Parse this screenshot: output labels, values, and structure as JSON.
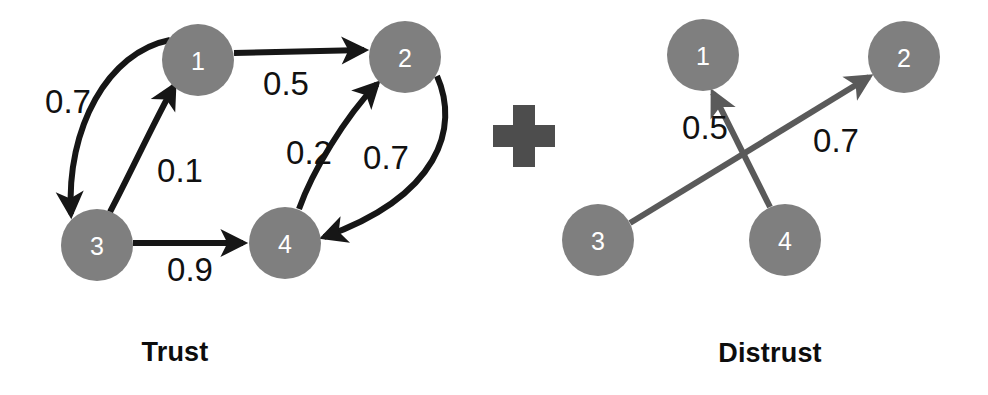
{
  "figure": {
    "width": 988,
    "height": 395,
    "background": "#ffffff",
    "operator": {
      "name": "plus-sign",
      "symbol": "+",
      "color": "#4d4d4d",
      "x": 524,
      "y": 136,
      "size": 62,
      "arm": 21
    }
  },
  "colors": {
    "node_fill": "#7f7f7f",
    "node_text": "#ffffff",
    "trust_edge": "#161616",
    "distrust_edge": "#5a5a5a",
    "weight_text": "#111111",
    "caption_text": "#0d0d0d"
  },
  "panels": [
    {
      "id": "trust",
      "caption": "Trust",
      "caption_x": 175,
      "caption_y": 352,
      "edge_color": "#161616",
      "edge_width": 6,
      "nodes": [
        {
          "id": "1",
          "label": "1",
          "cx": 198,
          "cy": 60,
          "r": 36
        },
        {
          "id": "2",
          "label": "2",
          "cx": 405,
          "cy": 57,
          "r": 36
        },
        {
          "id": "3",
          "label": "3",
          "cx": 97,
          "cy": 245,
          "r": 36
        },
        {
          "id": "4",
          "label": "4",
          "cx": 285,
          "cy": 243,
          "r": 36
        }
      ],
      "edges": [
        {
          "name": "edge-1-to-2",
          "from": "1",
          "to": "2",
          "weight": "0.5",
          "path": "M 234 53 L 364 50",
          "label_x": 286,
          "label_y": 83
        },
        {
          "name": "edge-1-to-3",
          "from": "1",
          "to": "3",
          "weight": "0.7",
          "path": "M 170 40 C 108 52, 66 128, 71 214",
          "label_x": 68,
          "label_y": 101
        },
        {
          "name": "edge-3-to-1",
          "from": "3",
          "to": "1",
          "weight": "0.1",
          "path": "M 110 212 C 132 170, 155 120, 174 86",
          "label_x": 180,
          "label_y": 170
        },
        {
          "name": "edge-3-to-4",
          "from": "3",
          "to": "4",
          "weight": "0.9",
          "path": "M 133 243 L 243 243",
          "label_x": 190,
          "label_y": 269
        },
        {
          "name": "edge-4-to-2",
          "from": "4",
          "to": "2",
          "weight": "0.2",
          "path": "M 299 209 C 312 172, 345 117, 377 84",
          "label_x": 309,
          "label_y": 152
        },
        {
          "name": "edge-2-to-4",
          "from": "2",
          "to": "4",
          "weight": "0.7",
          "path": "M 437 76 C 460 128, 439 196, 324 237",
          "label_x": 386,
          "label_y": 157
        }
      ]
    },
    {
      "id": "distrust",
      "caption": "Distrust",
      "caption_x": 770,
      "caption_y": 353,
      "edge_color": "#5a5a5a",
      "edge_width": 6,
      "nodes": [
        {
          "id": "1",
          "label": "1",
          "cx": 703,
          "cy": 55,
          "r": 36
        },
        {
          "id": "2",
          "label": "2",
          "cx": 904,
          "cy": 57,
          "r": 36
        },
        {
          "id": "3",
          "label": "3",
          "cx": 598,
          "cy": 240,
          "r": 36
        },
        {
          "id": "4",
          "label": "4",
          "cx": 785,
          "cy": 240,
          "r": 36
        }
      ],
      "edges": [
        {
          "name": "edge-4-to-1",
          "from": "4",
          "to": "1",
          "weight": "0.5",
          "path": "M 770 207 L 713 93",
          "label_x": 705,
          "label_y": 127
        },
        {
          "name": "edge-3-to-2",
          "from": "3",
          "to": "2",
          "weight": "0.7",
          "path": "M 630 223 L 869 77",
          "label_x": 836,
          "label_y": 140
        }
      ]
    }
  ]
}
